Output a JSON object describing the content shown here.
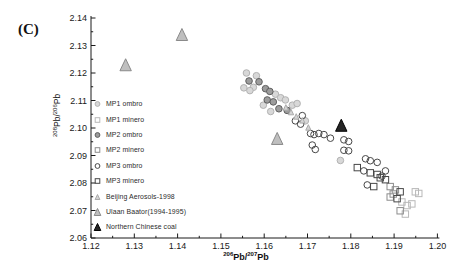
{
  "panel_label": "(C)",
  "axes": {
    "x": {
      "title_parts": [
        {
          "sup": "206"
        },
        {
          "text": "Pb/"
        },
        {
          "sup": "207"
        },
        {
          "text": "Pb"
        }
      ],
      "min": 1.12,
      "max": 1.2,
      "major": 0.01,
      "minor": 0.005,
      "decimals": 2
    },
    "y": {
      "title_parts": [
        {
          "sup": "208"
        },
        {
          "text": "Pb/"
        },
        {
          "sup": "206"
        },
        {
          "text": "Pb"
        }
      ],
      "min": 2.06,
      "max": 2.14,
      "major": 0.01,
      "minor": 0.005,
      "decimals": 2
    }
  },
  "chart_data": {
    "type": "scatter",
    "title": "",
    "xlabel": "206Pb/207Pb",
    "ylabel": "208Pb/206Pb",
    "xlim": [
      1.12,
      1.2
    ],
    "ylim": [
      2.06,
      2.14
    ],
    "grid": false,
    "legend_position": "inside-left",
    "series": [
      {
        "name": "MP1 ombro",
        "id": "mp1_ombro",
        "marker": "circle",
        "fill": "#d8d8d8",
        "stroke": "#b2b2b2",
        "size": 6.6,
        "points": [
          [
            1.1559,
            2.12
          ],
          [
            1.1582,
            2.119
          ],
          [
            1.1575,
            2.1148
          ],
          [
            1.1553,
            2.1146
          ],
          [
            1.1626,
            2.1123
          ],
          [
            1.1598,
            2.1083
          ],
          [
            1.1567,
            2.1136
          ],
          [
            1.1638,
            2.111
          ],
          [
            1.1649,
            2.1102
          ],
          [
            1.1665,
            2.1083
          ],
          [
            1.1676,
            2.1089
          ],
          [
            1.1615,
            2.106
          ],
          [
            1.1695,
            2.1026
          ],
          [
            1.1776,
            2.0882
          ]
        ]
      },
      {
        "name": "MP1 minero",
        "id": "mp1_minero",
        "marker": "square",
        "fill": "none",
        "stroke": "#b8b8b8",
        "size": 6.4,
        "points": [
          [
            1.1949,
            2.0768
          ],
          [
            1.1957,
            2.0762
          ],
          [
            1.193,
            2.0718
          ],
          [
            1.1941,
            2.0724
          ],
          [
            1.1926,
            2.0687
          ],
          [
            1.1918,
            2.0731
          ]
        ]
      },
      {
        "name": "MP2 ombro",
        "id": "mp2_ombro",
        "marker": "circle",
        "fill": "#9c9c9c",
        "stroke": "#5f5f5f",
        "size": 6.6,
        "points": [
          [
            1.1565,
            2.1171
          ],
          [
            1.1588,
            2.1168
          ],
          [
            1.1603,
            2.1143
          ],
          [
            1.1613,
            2.1133
          ],
          [
            1.1607,
            2.1102
          ],
          [
            1.1621,
            2.1095
          ],
          [
            1.1634,
            2.107
          ],
          [
            1.1653,
            2.1064
          ]
        ]
      },
      {
        "name": "MP2 minero",
        "id": "mp2_minero",
        "marker": "square",
        "fill": "none",
        "stroke": "#8c8c8c",
        "size": 6.4,
        "points": [
          [
            1.1891,
            2.0787
          ],
          [
            1.1903,
            2.0775
          ],
          [
            1.1891,
            2.0749
          ],
          [
            1.1914,
            2.0699
          ],
          [
            1.1898,
            2.076
          ]
        ]
      },
      {
        "name": "MP3 ombro",
        "id": "mp3_ombro",
        "marker": "circle",
        "fill": "none",
        "stroke": "#474747",
        "size": 6.6,
        "points": [
          [
            1.1688,
            2.1045
          ],
          [
            1.1672,
            2.1026
          ],
          [
            1.1684,
            2.1014
          ],
          [
            1.1707,
            2.098
          ],
          [
            1.1715,
            2.0976
          ],
          [
            1.1726,
            2.098
          ],
          [
            1.1738,
            2.0976
          ],
          [
            1.1718,
            2.0922
          ],
          [
            1.1711,
            2.0938
          ],
          [
            1.1753,
            2.0963
          ],
          [
            1.1784,
            2.0957
          ],
          [
            1.1795,
            2.0951
          ],
          [
            1.1784,
            2.0919
          ],
          [
            1.1795,
            2.0917
          ],
          [
            1.1834,
            2.0888
          ],
          [
            1.1845,
            2.0881
          ],
          [
            1.1861,
            2.0875
          ],
          [
            1.183,
            2.0844
          ],
          [
            1.1872,
            2.0825
          ],
          [
            1.188,
            2.0844
          ],
          [
            1.1838,
            2.0793
          ]
        ]
      },
      {
        "name": "MP3 minero",
        "id": "mp3_minero",
        "marker": "square",
        "fill": "none",
        "stroke": "#474747",
        "size": 6.4,
        "points": [
          [
            1.1815,
            2.0856
          ],
          [
            1.1845,
            2.0837
          ],
          [
            1.1861,
            2.0831
          ],
          [
            1.1853,
            2.0787
          ],
          [
            1.1868,
            2.0819
          ],
          [
            1.188,
            2.0812
          ],
          [
            1.1914,
            2.0768
          ],
          [
            1.1907,
            2.0743
          ]
        ]
      },
      {
        "name": "Beijing Aerosols-1998",
        "id": "beijing_aerosols",
        "marker": "triangle",
        "fill": "#d4d4d4",
        "stroke": "#aaaaaa",
        "size": 5.5,
        "points": [
          [
            1.165,
            2.1075
          ],
          [
            1.1662,
            2.1058
          ],
          [
            1.1674,
            2.1042
          ],
          [
            1.1688,
            2.1028
          ],
          [
            1.1702,
            2.1002
          ]
        ]
      },
      {
        "name": "Ulaan Baator(1994-1995)",
        "id": "ulaan_baator",
        "marker": "triangle",
        "fill": "#bfbfbf",
        "stroke": "#8a8a8a",
        "size": 12,
        "points": [
          [
            1.128,
            2.123
          ],
          [
            1.141,
            2.134
          ],
          [
            1.163,
            2.0962
          ]
        ]
      },
      {
        "name": "Northern Chinese coal",
        "id": "northern_chinese_coal",
        "marker": "triangle",
        "fill": "#262626",
        "stroke": "#000000",
        "size": 12,
        "points": [
          [
            1.1778,
            2.101
          ]
        ]
      }
    ]
  }
}
